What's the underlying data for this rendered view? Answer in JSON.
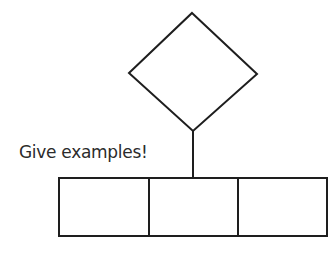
{
  "diagram": {
    "label": "Give examples!",
    "colors": {
      "stroke": "#1e1e1e",
      "text": "#2b2b2b",
      "background": "#ffffff"
    },
    "shapes": {
      "diamond": {
        "top": [
          192,
          13
        ],
        "right": [
          257,
          74
        ],
        "bottom": [
          193,
          131
        ],
        "left": [
          129,
          73
        ]
      },
      "connector": {
        "from": [
          193,
          131
        ],
        "to": [
          193,
          178
        ]
      },
      "boxes": [
        {
          "x": 59,
          "y": 178,
          "w": 90,
          "h": 58
        },
        {
          "x": 149,
          "y": 178,
          "w": 89,
          "h": 58
        },
        {
          "x": 238,
          "y": 178,
          "w": 89,
          "h": 58
        }
      ]
    }
  }
}
